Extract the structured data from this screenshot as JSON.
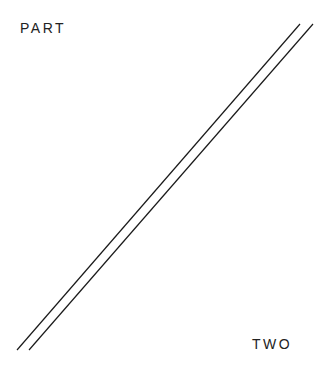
{
  "page": {
    "top_label": "PART",
    "bottom_label": "TWO",
    "line_color": "#1a1a1a",
    "divider_lines": [
      {
        "x1": 300,
        "y1": 24,
        "x2": 17,
        "y2": 350
      },
      {
        "x1": 313,
        "y1": 24,
        "x2": 29,
        "y2": 350
      }
    ]
  }
}
